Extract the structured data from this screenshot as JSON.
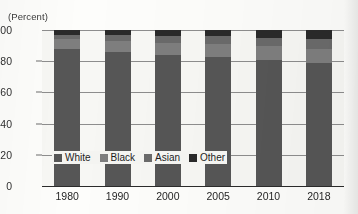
{
  "chart_data": {
    "type": "bar",
    "subtype": "stacked-100-percent",
    "title": "",
    "subtitle": "",
    "xlabel": "",
    "ylabel": "",
    "unit_caption": "(Percent)",
    "categories": [
      "1980",
      "1990",
      "2000",
      "2005",
      "2010",
      "2018"
    ],
    "series": [
      {
        "name": "White",
        "color": "#565656",
        "values": [
          88,
          86,
          84,
          83,
          81,
          79
        ]
      },
      {
        "name": "Black",
        "color": "#7e7e7e",
        "values": [
          6,
          7,
          8,
          8,
          9,
          9
        ]
      },
      {
        "name": "Asian",
        "color": "#6a6a6a",
        "values": [
          3,
          4,
          4,
          5,
          5,
          6
        ]
      },
      {
        "name": "Other",
        "color": "#2a2a2a",
        "values": [
          3,
          3,
          4,
          4,
          5,
          6
        ]
      }
    ],
    "ylim": [
      0,
      100
    ],
    "yticks": [
      0,
      20,
      40,
      60,
      80,
      100
    ],
    "ytick_labels": [
      "0",
      "20",
      "40",
      "60",
      "80",
      "100"
    ],
    "grid": true,
    "grid_axis": "y",
    "legend_position": "inside-bottom-left",
    "legend_entries": [
      "White",
      "Black",
      "Asian",
      "Other"
    ]
  },
  "legend": {
    "items": [
      {
        "label": "White",
        "color": "#565656"
      },
      {
        "label": "Black",
        "color": "#7e7e7e"
      },
      {
        "label": "Asian",
        "color": "#6a6a6a"
      },
      {
        "label": "Other",
        "color": "#2a2a2a"
      }
    ]
  }
}
